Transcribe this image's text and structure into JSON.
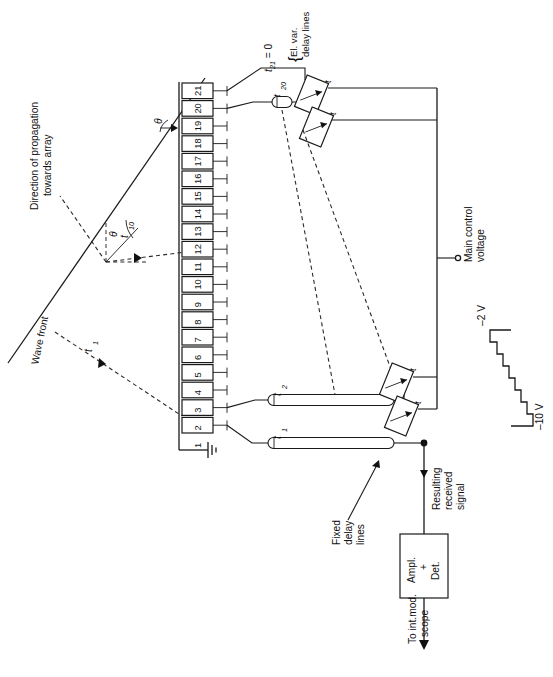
{
  "figure": {
    "type": "schematic",
    "background_color": "#ffffff",
    "line_color": "#1a1a1a",
    "orientation_note": "all text rendered rotated 90 degrees counter-clockwise"
  },
  "wavefront": {
    "direction_label": "Direction of propagation",
    "direction_label_2": "towards array",
    "wave_front_label": "Wave front",
    "angle_symbol": "θ",
    "angle_symbol_2": "θ",
    "delay_t1": "t",
    "delay_t1_sub": "1",
    "delay_t10": "t",
    "delay_t10_sub": "10"
  },
  "array": {
    "name": "antenna-element-array",
    "count": 21,
    "elements": [
      "1",
      "2",
      "3",
      "4",
      "5",
      "6",
      "7",
      "8",
      "9",
      "10",
      "11",
      "12",
      "13",
      "14",
      "15",
      "16",
      "17",
      "18",
      "19",
      "20",
      "21"
    ],
    "ground_symbol": "earth-ground"
  },
  "delay_lines": {
    "fixed_label_1": "Fixed",
    "fixed_label_2": "delay",
    "fixed_label_3": "lines",
    "fixed_t1": "t",
    "fixed_t1_sub": "1",
    "fixed_t2": "t",
    "fixed_t2_sub": "2",
    "t20": "t",
    "t20_sub": "20",
    "t21_zero": "t",
    "t21_zero_sub": "21",
    "t21_zero_eq": " = 0",
    "variable_label_1": "El. var.",
    "variable_label_2": "delay lines",
    "variable_brace": "{",
    "variable_t": "t"
  },
  "control": {
    "main_label_1": "Main control",
    "main_label_2": "voltage",
    "terminal": "control-terminal",
    "staircase": {
      "top_voltage": "–2 V",
      "bottom_voltage": "–10 V",
      "steps": 8
    }
  },
  "output": {
    "resulting_1": "Resulting",
    "resulting_2": "received",
    "resulting_3": "signal",
    "amplifier_line1": "Ampl.",
    "amplifier_line2": "+",
    "amplifier_line3": "Det.",
    "scope_line1": "To int.mod.",
    "scope_line2": "scope"
  }
}
